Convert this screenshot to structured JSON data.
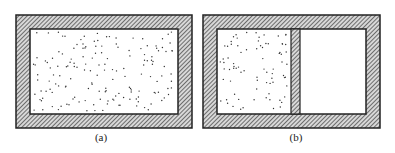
{
  "figure": {
    "panels": [
      {
        "id": "a",
        "label": "(a)",
        "outer": {
          "x": 16,
          "y": 15,
          "w": 176,
          "h": 113
        },
        "inner": {
          "x": 30,
          "y": 29,
          "w": 148,
          "h": 85
        },
        "partition": null,
        "gas_region": {
          "x": 31,
          "y": 30,
          "w": 146,
          "h": 83
        },
        "particle_count": 160,
        "seed": 7
      },
      {
        "id": "b",
        "label": "(b)",
        "outer": {
          "x": 203,
          "y": 15,
          "w": 177,
          "h": 113
        },
        "inner": {
          "x": 217,
          "y": 29,
          "w": 149,
          "h": 85
        },
        "partition": {
          "x": 291,
          "y": 29,
          "w": 9,
          "h": 85
        },
        "gas_region": {
          "x": 218,
          "y": 30,
          "w": 71,
          "h": 83
        },
        "particle_count": 80,
        "seed": 13
      }
    ],
    "colors": {
      "wall_stroke": "#222222",
      "hatch_line": "#333333",
      "hatch_bg": "#d8d8d8",
      "interior": "#ffffff",
      "particle": "#333333"
    }
  }
}
